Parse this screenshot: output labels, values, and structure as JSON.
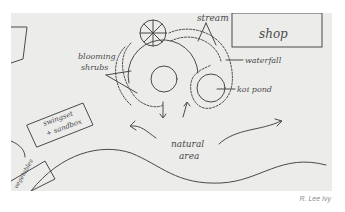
{
  "sketch": {
    "title": "Garden plan sketch",
    "labels": {
      "stream": "stream",
      "shop": "shop",
      "waterfall": "waterfall",
      "koi_pond": "koi pond",
      "blooming_shrubs_line1": "blooming",
      "blooming_shrubs_line2": "shrubs",
      "swingset_line1": "swingset",
      "swingset_line2": "+ sandbox",
      "vegetables": "vegetables",
      "natural_area_line1": "natural",
      "natural_area_line2": "area"
    },
    "colors": {
      "paper": "#ececea",
      "pencil": "#4a4a4a",
      "background": "#ffffff"
    }
  },
  "credit": "R. Lee Ivy"
}
